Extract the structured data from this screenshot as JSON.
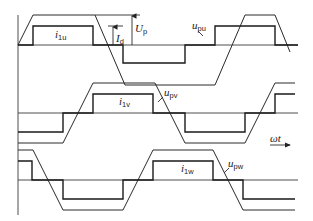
{
  "diagram": {
    "type": "waveform-diagram",
    "colors": {
      "line": "#222222",
      "background": "#ffffff"
    },
    "panels": [
      {
        "phase": "u",
        "current_label": {
          "main": "i",
          "sub": "1u"
        },
        "voltage_label": {
          "main": "u",
          "sub": "pu"
        },
        "axis_y": 45,
        "voltage_points": "18,45 33,15 95,15 125,85 215,85 245,15 275,15 290,52",
        "current_points": "18,45 33,45 33,26 93,26 93,45 123,45 123,63 185,63 185,45 215,45 215,26 275,26 275,45 298,45"
      },
      {
        "phase": "v",
        "current_label": {
          "main": "i",
          "sub": "1v"
        },
        "voltage_label": {
          "main": "u",
          "sub": "pv"
        },
        "axis_y": 113,
        "voltage_points": "18,143 63,143 93,83 155,83 185,143 245,143 275,83 295,83",
        "current_points": "18,132 63,132 63,113 93,113 93,94 153,94 153,113 185,113 185,132 245,132 245,113 275,113 275,94 295,94"
      },
      {
        "phase": "w",
        "current_label": {
          "main": "i",
          "sub": "1w"
        },
        "voltage_label": {
          "main": "u",
          "sub": "pw"
        },
        "axis_y": 180,
        "voltage_points": "18,150 33,150 63,210 123,210 153,150 213,150 243,210 295,210",
        "current_points": "18,161 32,161 32,180 63,180 63,199 123,199 123,180 153,180 153,161 213,161 213,180 243,180 243,199 295,199"
      }
    ],
    "annotations": {
      "current_amplitude": {
        "main": "I",
        "sub": "d"
      },
      "voltage_amplitude": {
        "main": "U",
        "sub": "p"
      },
      "time_axis": "ωt"
    }
  }
}
